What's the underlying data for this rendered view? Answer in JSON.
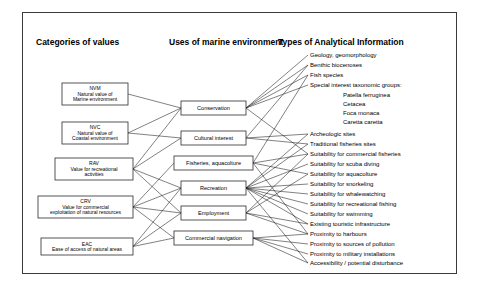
{
  "figure": {
    "background_color": "#ffffff",
    "frame_color": "#3a3a3a",
    "line_color": "#1a1a1a",
    "box_fill": "#ffffff",
    "box_stroke": "#2b2b2b"
  },
  "headers": [
    {
      "id": "h1",
      "label": "Categories of values",
      "x": 36,
      "y": 45
    },
    {
      "id": "h2",
      "label": "Uses of marine environment",
      "x": 169,
      "y": 45
    },
    {
      "id": "h3",
      "label": "Types of Analytical Information",
      "x": 278,
      "y": 45
    }
  ],
  "categories": [
    {
      "id": "NVM",
      "code": "NVM",
      "lines": [
        "NVM",
        "Natural value of",
        "Marine environment"
      ],
      "x": 62,
      "y": 83,
      "w": 66,
      "h": 22
    },
    {
      "id": "NVC",
      "code": "NVC",
      "lines": [
        "NVC",
        "Natural value of",
        "Coastal environment"
      ],
      "x": 62,
      "y": 122,
      "w": 66,
      "h": 22
    },
    {
      "id": "RAV",
      "code": "RAV",
      "lines": [
        "RAV",
        "Value for recreational",
        "activities"
      ],
      "x": 55,
      "y": 158,
      "w": 78,
      "h": 22
    },
    {
      "id": "CRV",
      "code": "CRV",
      "lines": [
        "CRV",
        "Value for commercial",
        "exploitation of natural resources"
      ],
      "x": 38,
      "y": 196,
      "w": 95,
      "h": 22
    },
    {
      "id": "EAC",
      "code": "EAC",
      "lines": [
        "EAC",
        "Ease of access of natural areas"
      ],
      "x": 41,
      "y": 238,
      "w": 92,
      "h": 17
    }
  ],
  "uses": [
    {
      "id": "conservation",
      "label": "Conservation",
      "x": 181,
      "y": 101,
      "w": 65,
      "h": 14
    },
    {
      "id": "cultural",
      "label": "Cultural interest",
      "x": 181,
      "y": 131,
      "w": 65,
      "h": 14
    },
    {
      "id": "fisheries",
      "label": "Fisheries, aquacolture",
      "x": 174,
      "y": 156,
      "w": 79,
      "h": 14
    },
    {
      "id": "recreation",
      "label": "Recreation",
      "x": 181,
      "y": 181,
      "w": 65,
      "h": 14
    },
    {
      "id": "employment",
      "label": "Employment",
      "x": 181,
      "y": 206,
      "w": 65,
      "h": 14
    },
    {
      "id": "navigation",
      "label": "Commercial navigation",
      "x": 174,
      "y": 231,
      "w": 79,
      "h": 14
    }
  ],
  "analytical_information": [
    {
      "id": "a1",
      "label": "Geology, geomorphology",
      "x": 310,
      "y": 57,
      "indent": false
    },
    {
      "id": "a2",
      "label": "Benthic biocenoses",
      "x": 310,
      "y": 67,
      "indent": false
    },
    {
      "id": "a3",
      "label": "Fish species",
      "x": 310,
      "y": 77,
      "indent": false
    },
    {
      "id": "a4",
      "label": "Special interest taxonomic groups:",
      "x": 310,
      "y": 87,
      "indent": false
    },
    {
      "id": "a5",
      "label": "Patella ferruginea",
      "x": 343,
      "y": 97,
      "indent": true
    },
    {
      "id": "a6",
      "label": "Cetacea",
      "x": 343,
      "y": 106,
      "indent": true
    },
    {
      "id": "a7",
      "label": "Foca monaca",
      "x": 343,
      "y": 115,
      "indent": true
    },
    {
      "id": "a8",
      "label": "Caretta caretta",
      "x": 343,
      "y": 124,
      "indent": true
    },
    {
      "id": "a9",
      "label": "Archeologic sites",
      "x": 310,
      "y": 136,
      "indent": false
    },
    {
      "id": "a10",
      "label": "Traditional fisheries sites",
      "x": 310,
      "y": 146,
      "indent": false
    },
    {
      "id": "a11",
      "label": "Suitability for commercial fisheries",
      "x": 310,
      "y": 156,
      "indent": false
    },
    {
      "id": "a12",
      "label": "Suitability for scuba diving",
      "x": 310,
      "y": 166,
      "indent": false
    },
    {
      "id": "a13",
      "label": "Suitability for aquacolture",
      "x": 310,
      "y": 176,
      "indent": false
    },
    {
      "id": "a14",
      "label": "Suitability for snorkeling",
      "x": 310,
      "y": 186,
      "indent": false
    },
    {
      "id": "a15",
      "label": "Suitability for whalewatching",
      "x": 310,
      "y": 196,
      "indent": false
    },
    {
      "id": "a16",
      "label": "Suitability for recreational fishing",
      "x": 310,
      "y": 206,
      "indent": false
    },
    {
      "id": "a17",
      "label": "Suitability for swimming",
      "x": 310,
      "y": 216,
      "indent": false
    },
    {
      "id": "a18",
      "label": "Existing touristic infrastructure",
      "x": 310,
      "y": 226,
      "indent": false
    },
    {
      "id": "a19",
      "label": "Proximity to harbours",
      "x": 310,
      "y": 236,
      "indent": false
    },
    {
      "id": "a20",
      "label": "Proximity to sources of pollution",
      "x": 310,
      "y": 246,
      "indent": false
    },
    {
      "id": "a21",
      "label": "Proximity to military installations",
      "x": 310,
      "y": 256,
      "indent": false
    },
    {
      "id": "a22",
      "label": "Accessibility / potential disturbance",
      "x": 310,
      "y": 265,
      "indent": false
    }
  ],
  "links_categories_to_uses": [
    {
      "from": "NVM",
      "to": "conservation"
    },
    {
      "from": "NVC",
      "to": "conservation"
    },
    {
      "from": "NVC",
      "to": "cultural"
    },
    {
      "from": "RAV",
      "to": "conservation"
    },
    {
      "from": "RAV",
      "to": "cultural"
    },
    {
      "from": "RAV",
      "to": "recreation"
    },
    {
      "from": "RAV",
      "to": "employment"
    },
    {
      "from": "CRV",
      "to": "fisheries"
    },
    {
      "from": "CRV",
      "to": "recreation"
    },
    {
      "from": "CRV",
      "to": "employment"
    },
    {
      "from": "CRV",
      "to": "navigation"
    },
    {
      "from": "EAC",
      "to": "recreation"
    },
    {
      "from": "EAC",
      "to": "employment"
    },
    {
      "from": "EAC",
      "to": "navigation"
    }
  ],
  "links_uses_to_information": [
    {
      "from": "conservation",
      "to": "a1"
    },
    {
      "from": "conservation",
      "to": "a2"
    },
    {
      "from": "conservation",
      "to": "a3"
    },
    {
      "from": "conservation",
      "to": "a4"
    },
    {
      "from": "conservation",
      "to": "a11"
    },
    {
      "from": "cultural",
      "to": "a9"
    },
    {
      "from": "cultural",
      "to": "a10"
    },
    {
      "from": "cultural",
      "to": "a2"
    },
    {
      "from": "fisheries",
      "to": "a11"
    },
    {
      "from": "fisheries",
      "to": "a13"
    },
    {
      "from": "fisheries",
      "to": "a3"
    },
    {
      "from": "fisheries",
      "to": "a19"
    },
    {
      "from": "recreation",
      "to": "a12"
    },
    {
      "from": "recreation",
      "to": "a14"
    },
    {
      "from": "recreation",
      "to": "a15"
    },
    {
      "from": "recreation",
      "to": "a16"
    },
    {
      "from": "recreation",
      "to": "a17"
    },
    {
      "from": "recreation",
      "to": "a18"
    },
    {
      "from": "recreation",
      "to": "a22"
    },
    {
      "from": "recreation",
      "to": "a9"
    },
    {
      "from": "recreation",
      "to": "a10"
    },
    {
      "from": "employment",
      "to": "a18"
    },
    {
      "from": "employment",
      "to": "a19"
    },
    {
      "from": "employment",
      "to": "a11"
    },
    {
      "from": "employment",
      "to": "a13"
    },
    {
      "from": "navigation",
      "to": "a19"
    },
    {
      "from": "navigation",
      "to": "a20"
    },
    {
      "from": "navigation",
      "to": "a21"
    },
    {
      "from": "navigation",
      "to": "a22"
    }
  ]
}
